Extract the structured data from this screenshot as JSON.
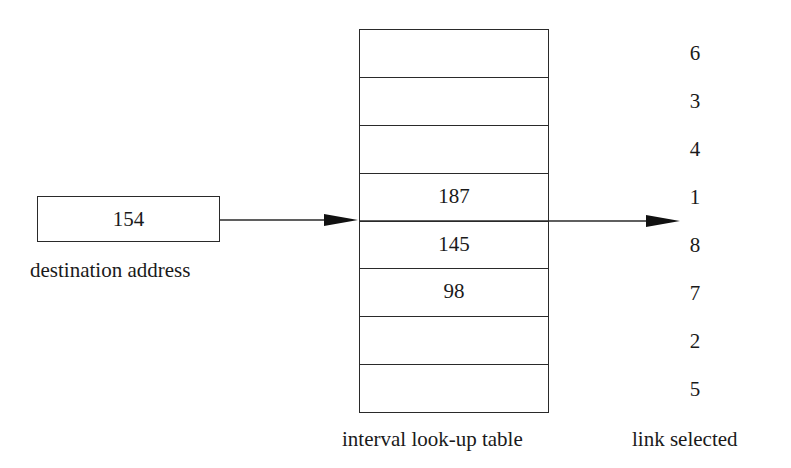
{
  "input": {
    "value": "154",
    "label": "destination address"
  },
  "table": {
    "label": "interval look-up table",
    "rows": [
      "",
      "",
      "",
      "187",
      "145",
      "98",
      "",
      ""
    ]
  },
  "links": {
    "label": "link selected",
    "values": [
      "6",
      "3",
      "4",
      "1",
      "8",
      "7",
      "2",
      "5"
    ]
  },
  "colors": {
    "stroke": "#2a2a2a",
    "background": "#ffffff"
  }
}
